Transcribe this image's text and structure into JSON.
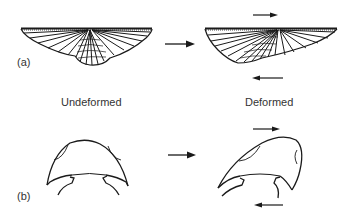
{
  "figure": {
    "panels": [
      {
        "label": "(a)",
        "subject": "brachiopod-shell"
      },
      {
        "label": "(b)",
        "subject": "trilobite-cephalon"
      }
    ],
    "column_headings": {
      "left": "Undeformed",
      "right": "Deformed"
    },
    "arrows": {
      "transform": "right-arrow",
      "shear_top": "right-arrow",
      "shear_bottom": "left-arrow"
    },
    "colors": {
      "line": "#1a1a1a",
      "background": "#ffffff"
    }
  }
}
